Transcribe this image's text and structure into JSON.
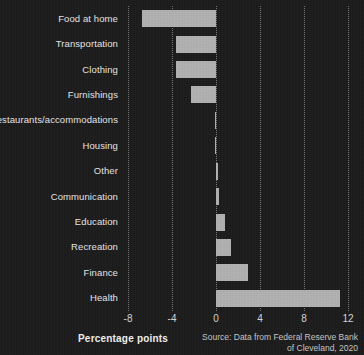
{
  "chart_data": {
    "type": "bar",
    "orientation": "horizontal",
    "title": "",
    "xlabel": "Percentage points",
    "ylabel": "",
    "xlim": [
      -8,
      12
    ],
    "xticks": [
      -8,
      -4,
      0,
      4,
      8,
      12
    ],
    "xtick_labels": [
      "-8",
      "-4",
      "0",
      "4",
      "8",
      "12"
    ],
    "grid": true,
    "grid_axis": "x",
    "grid_style": "dotted",
    "legend": false,
    "categories": [
      "Food at home",
      "Transportation",
      "Clothing",
      "Furnishings",
      "Restaurants/accommodations",
      "Housing",
      "Other",
      "Communication",
      "Education",
      "Recreation",
      "Finance",
      "Health"
    ],
    "values": [
      -6.7,
      -3.6,
      -3.6,
      -2.3,
      -0.1,
      -0.1,
      0.2,
      0.3,
      0.8,
      1.4,
      2.9,
      11.3
    ],
    "annotations": [
      "Source: Data from Federal Reserve Bank",
      "of Cleveland, 2020"
    ],
    "colors": {
      "background": "#1c1c1c",
      "bar": "#b2b2b2",
      "grid": "#8a8a8a",
      "text": "#e8e8e8",
      "tick_text": "#d8d8d8",
      "source_text": "#c9c9c9"
    }
  },
  "source": {
    "line1": "Source: Data from Federal Reserve Bank",
    "line2": "of Cleveland, 2020"
  },
  "axis": {
    "title": "Percentage points"
  }
}
